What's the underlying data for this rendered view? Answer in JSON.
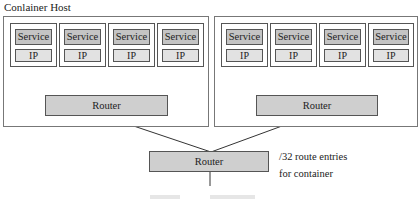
{
  "diagram": {
    "title": "Conlainer Host",
    "hosts": [
      {
        "containers": [
          {
            "service": "Service",
            "ip": "IP"
          },
          {
            "service": "Service",
            "ip": "IP"
          },
          {
            "service": "Service",
            "ip": "IP"
          },
          {
            "service": "Service",
            "ip": "IP"
          }
        ],
        "router": "Router"
      },
      {
        "containers": [
          {
            "service": "Service",
            "ip": "IP"
          },
          {
            "service": "Service",
            "ip": "IP"
          },
          {
            "service": "Service",
            "ip": "IP"
          },
          {
            "service": "Service",
            "ip": "IP"
          }
        ],
        "router": "Router"
      }
    ],
    "top_router": "Router",
    "annotation": {
      "line1": "/32 route entries",
      "line2": "for container"
    },
    "caption": "Figure … (partially visible)"
  },
  "colors": {
    "service_fill": "#c4c4c4",
    "ip_fill": "#e2e2e2",
    "router_fill": "#cfcfcf",
    "border": "#555555"
  }
}
